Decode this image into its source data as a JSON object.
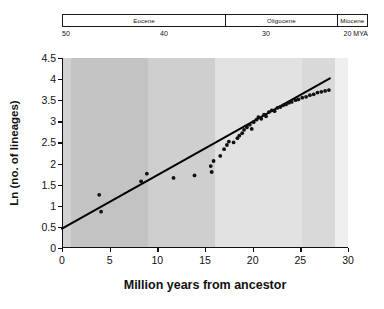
{
  "epoch_axis": {
    "name": "geologic-epoch-scale",
    "unit_label": "MYA",
    "scale_min": 20,
    "scale_max": 50,
    "ticks": [
      {
        "value": 50,
        "label": "50"
      },
      {
        "value": 40,
        "label": "40"
      },
      {
        "value": 30,
        "label": "30"
      },
      {
        "value": 20,
        "label": "20 MYA"
      }
    ],
    "epochs": [
      {
        "label": "Eocene",
        "start_mya": 50,
        "end_mya": 34.0
      },
      {
        "label": "Oligocene",
        "start_mya": 34.0,
        "end_mya": 23.0
      },
      {
        "label": "Miocene",
        "start_mya": 23.0,
        "end_mya": 20
      }
    ]
  },
  "chart_data": {
    "type": "scatter",
    "title": "",
    "xlabel": "Million years from ancestor",
    "ylabel": "Ln (no. of lineages)",
    "xlim": [
      0,
      30
    ],
    "ylim": [
      0,
      4.5
    ],
    "xticks": [
      0,
      5,
      10,
      15,
      20,
      25,
      30
    ],
    "xtick_labels": [
      "0",
      "5",
      "10",
      "15",
      "20",
      "25",
      "30"
    ],
    "yticks": [
      0,
      0.5,
      1,
      1.5,
      2,
      2.5,
      3,
      3.5,
      4,
      4.5
    ],
    "ytick_labels": [
      "0",
      "0.5",
      "1",
      "1.5",
      "2",
      "2.5",
      "3",
      "3.5",
      "4",
      "4.5"
    ],
    "grid": false,
    "legend": "none",
    "point_color": "#111111",
    "line_color": "#000000",
    "background_bands": [
      {
        "x_start": 0.0,
        "x_end": 0.9,
        "color": "#d2d2d2"
      },
      {
        "x_start": 0.9,
        "x_end": 9.0,
        "color": "#c3c3c3"
      },
      {
        "x_start": 9.0,
        "x_end": 16.0,
        "color": "#cfcfcf"
      },
      {
        "x_start": 16.0,
        "x_end": 25.2,
        "color": "#e2e2e2"
      },
      {
        "x_start": 25.2,
        "x_end": 28.6,
        "color": "#d9d9d9"
      },
      {
        "x_start": 28.6,
        "x_end": 30.0,
        "color": "#efefef"
      }
    ],
    "series": [
      {
        "name": "lineage accumulation",
        "points": [
          [
            3.9,
            1.26
          ],
          [
            4.1,
            0.86
          ],
          [
            8.3,
            1.58
          ],
          [
            8.9,
            1.76
          ],
          [
            11.7,
            1.66
          ],
          [
            13.9,
            1.72
          ],
          [
            15.6,
            1.94
          ],
          [
            15.7,
            1.8
          ],
          [
            15.9,
            2.06
          ],
          [
            16.6,
            2.18
          ],
          [
            17.0,
            2.34
          ],
          [
            17.3,
            2.44
          ],
          [
            17.5,
            2.52
          ],
          [
            18.0,
            2.5
          ],
          [
            18.4,
            2.6
          ],
          [
            18.6,
            2.66
          ],
          [
            18.9,
            2.72
          ],
          [
            19.1,
            2.8
          ],
          [
            19.4,
            2.86
          ],
          [
            19.7,
            2.92
          ],
          [
            19.9,
            2.82
          ],
          [
            20.1,
            2.98
          ],
          [
            20.4,
            3.04
          ],
          [
            20.6,
            3.1
          ],
          [
            20.9,
            3.06
          ],
          [
            21.2,
            3.16
          ],
          [
            21.4,
            3.12
          ],
          [
            21.7,
            3.22
          ],
          [
            22.0,
            3.26
          ],
          [
            22.3,
            3.24
          ],
          [
            22.6,
            3.32
          ],
          [
            22.9,
            3.34
          ],
          [
            23.2,
            3.38
          ],
          [
            23.5,
            3.4
          ],
          [
            23.8,
            3.44
          ],
          [
            24.1,
            3.46
          ],
          [
            24.5,
            3.5
          ],
          [
            24.8,
            3.52
          ],
          [
            25.2,
            3.56
          ],
          [
            25.6,
            3.58
          ],
          [
            26.0,
            3.62
          ],
          [
            26.4,
            3.64
          ],
          [
            26.8,
            3.68
          ],
          [
            27.2,
            3.7
          ],
          [
            27.6,
            3.72
          ],
          [
            28.0,
            3.74
          ]
        ]
      }
    ],
    "fit_line": {
      "name": "regression line",
      "x_start": 0.0,
      "y_start": 0.46,
      "x_end": 28.1,
      "y_end": 4.02
    }
  }
}
